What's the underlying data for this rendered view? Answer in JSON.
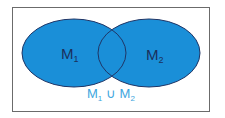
{
  "diagram": {
    "type": "venn",
    "operation": "union",
    "colors": {
      "fill": "#1a8fd8",
      "stroke": "#1f3566",
      "set_label": "#1b2f5c",
      "union_label": "#3ea6de",
      "frame": "#6b6b6b"
    },
    "sets": [
      {
        "base": "M",
        "index": "1"
      },
      {
        "base": "M",
        "index": "2"
      }
    ],
    "caption": {
      "left_base": "M",
      "left_index": "1",
      "operator": "∪",
      "right_base": "M",
      "right_index": "2"
    }
  }
}
